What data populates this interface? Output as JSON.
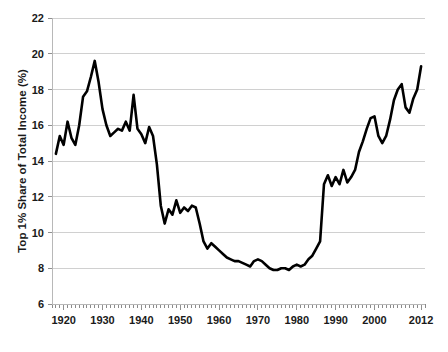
{
  "chart_data": {
    "type": "line",
    "title": "",
    "subtitle": "",
    "xlabel": "",
    "ylabel": "Top 1% Share of Total Income (%)",
    "xlim": [
      1917,
      2013
    ],
    "ylim": [
      6,
      22
    ],
    "grid": true,
    "legend": false,
    "legend_position": "none",
    "line_color": "#000000",
    "gridline_color": "#d0d0d0",
    "axis_color": "#b8b8b8",
    "text_color": "#1a1a1a",
    "y_ticks": [
      6,
      8,
      10,
      12,
      14,
      16,
      18,
      20,
      22
    ],
    "y_tick_labels": [
      "6",
      "8",
      "10",
      "12",
      "14",
      "16",
      "18",
      "20",
      "22"
    ],
    "x_ticks": [
      1920,
      1930,
      1940,
      1950,
      1960,
      1970,
      1980,
      1990,
      2000,
      2012
    ],
    "x_tick_labels": [
      "1920",
      "1930",
      "1940",
      "1950",
      "1960",
      "1970",
      "1980",
      "1990",
      "2000",
      "2012"
    ],
    "x_minor_tick_step": 1,
    "series": [
      {
        "name": "Top 1% Share of Total Income",
        "x": [
          1918,
          1919,
          1920,
          1921,
          1922,
          1923,
          1924,
          1925,
          1926,
          1927,
          1928,
          1929,
          1930,
          1931,
          1932,
          1933,
          1934,
          1935,
          1936,
          1937,
          1938,
          1939,
          1940,
          1941,
          1942,
          1943,
          1944,
          1945,
          1946,
          1947,
          1948,
          1949,
          1950,
          1951,
          1952,
          1953,
          1954,
          1955,
          1956,
          1957,
          1958,
          1959,
          1960,
          1961,
          1962,
          1963,
          1964,
          1965,
          1966,
          1967,
          1968,
          1969,
          1970,
          1971,
          1972,
          1973,
          1974,
          1975,
          1976,
          1977,
          1978,
          1979,
          1980,
          1981,
          1982,
          1983,
          1984,
          1985,
          1986,
          1987,
          1988,
          1989,
          1990,
          1991,
          1992,
          1993,
          1994,
          1995,
          1996,
          1997,
          1998,
          1999,
          2000,
          2001,
          2002,
          2003,
          2004,
          2005,
          2006,
          2007,
          2008,
          2009,
          2010,
          2011,
          2012
        ],
        "values": [
          14.4,
          15.4,
          14.9,
          16.2,
          15.3,
          14.9,
          16.0,
          17.6,
          17.9,
          18.7,
          19.6,
          18.4,
          16.9,
          16.0,
          15.4,
          15.6,
          15.8,
          15.7,
          16.2,
          15.7,
          17.7,
          15.8,
          15.5,
          15.0,
          15.9,
          15.4,
          13.8,
          11.5,
          10.5,
          11.3,
          11.0,
          11.8,
          11.1,
          11.4,
          11.2,
          11.5,
          11.4,
          10.5,
          9.5,
          9.1,
          9.4,
          9.2,
          9.0,
          8.8,
          8.6,
          8.5,
          8.4,
          8.4,
          8.3,
          8.2,
          8.1,
          8.4,
          8.5,
          8.4,
          8.2,
          8.0,
          7.9,
          7.9,
          8.0,
          8.0,
          7.9,
          8.1,
          8.2,
          8.1,
          8.2,
          8.5,
          8.7,
          9.1,
          9.5,
          12.7,
          13.2,
          12.6,
          13.1,
          12.7,
          13.5,
          12.8,
          13.1,
          13.5,
          14.5,
          15.1,
          15.8,
          16.4,
          16.5,
          15.4,
          15.0,
          15.4,
          16.3,
          17.4,
          18.0,
          18.3,
          17.0,
          16.7,
          17.5,
          18.0,
          19.3
        ]
      }
    ]
  },
  "axis_titles": {
    "y": "Top 1% Share of Total Income (%)"
  }
}
